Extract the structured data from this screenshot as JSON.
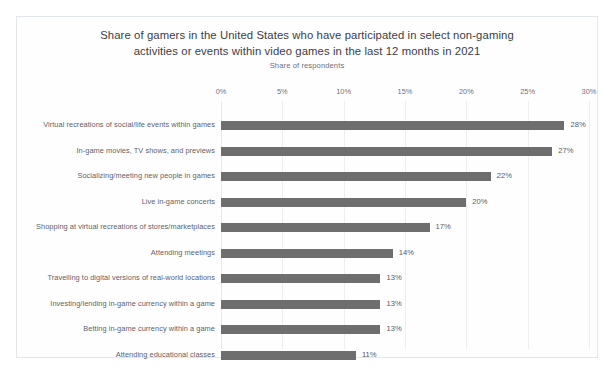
{
  "chart_data": {
    "type": "bar",
    "orientation": "horizontal",
    "title": "Share of gamers in the United States who have participated in select non-gaming activities or events within video games in the last 12 months in 2021",
    "title_lines": [
      "Share of gamers in the United States who have participated in select non-gaming",
      "activities or events within video games in the last 12 months in 2021"
    ],
    "subtitle": "Share of respondents",
    "xlabel": "",
    "ylabel": "",
    "xlim": [
      0,
      30
    ],
    "xtick_labels": [
      "0%",
      "5%",
      "10%",
      "15%",
      "20%",
      "25%",
      "30%"
    ],
    "xtick_values": [
      0,
      5,
      10,
      15,
      20,
      25,
      30
    ],
    "grid": "vertical",
    "legend": "none",
    "bar_color": "#6e6e6e",
    "categories": [
      "Virtual recreations of social/life events within games",
      "In-game movies, TV shows, and previews",
      "Socializing/meeting new people in games",
      "Live in-game concerts",
      "Shopping at virtual recreations of stores/marketplaces",
      "Attending meetings",
      "Travelling to digital versions of real-world locations",
      "Investing/lending in-game currency within a game",
      "Betting in-game currency within a game",
      "Attending educational classes"
    ],
    "values": [
      28,
      27,
      22,
      20,
      17,
      14,
      13,
      13,
      13,
      11
    ],
    "value_labels": [
      "28%",
      "27%",
      "22%",
      "20%",
      "17%",
      "14%",
      "13%",
      "13%",
      "13%",
      "11%"
    ]
  }
}
